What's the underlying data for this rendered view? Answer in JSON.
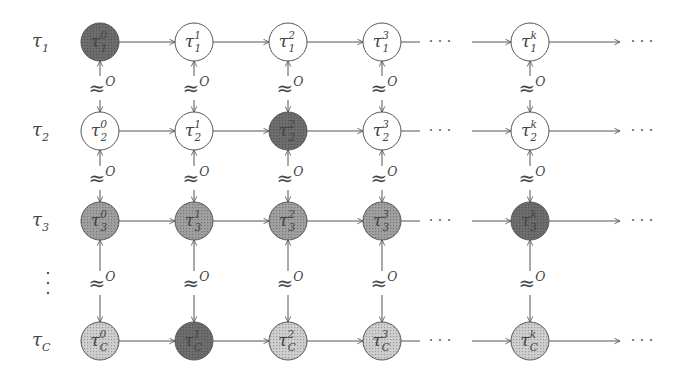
{
  "diagram": {
    "type": "task-state lattice",
    "row_labels": [
      {
        "base": "τ",
        "sub": "1"
      },
      {
        "base": "τ",
        "sub": "2"
      },
      {
        "base": "τ",
        "sub": "3"
      },
      {
        "base": "⋮",
        "sub": ""
      },
      {
        "base": "τ",
        "sub": "C"
      }
    ],
    "column_superscripts": [
      "0",
      "1",
      "2",
      "3",
      "k"
    ],
    "relation_label": {
      "base": "≈",
      "sup": "O"
    },
    "ellipsis": "· · ·",
    "fill_colors": {
      "white": "#ffffff",
      "dark": "#6e6e6e",
      "medium": "#a0a0a0",
      "light": "#cfcfcf"
    },
    "rows": [
      {
        "sub": "1",
        "y": 42,
        "fills": [
          "dark",
          "white",
          "white",
          "white",
          "white"
        ]
      },
      {
        "sub": "2",
        "y": 131,
        "fills": [
          "white",
          "white",
          "dark",
          "white",
          "white"
        ]
      },
      {
        "sub": "3",
        "y": 221,
        "fills": [
          "medium",
          "medium",
          "medium",
          "medium",
          "dark"
        ]
      },
      {
        "sub": "C",
        "y": 341,
        "fills": [
          "light",
          "dark",
          "light",
          "light",
          "light"
        ]
      }
    ],
    "column_x": [
      100,
      194,
      288,
      382,
      530
    ],
    "relation_rows_y": [
      88,
      178,
      283
    ]
  }
}
